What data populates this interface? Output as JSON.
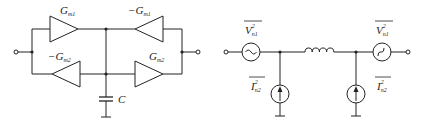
{
  "diagram": {
    "left_circuit": {
      "description": "Gyrator-C active inductor",
      "transconductors": [
        {
          "id": "top-left",
          "sign": "",
          "symbol": "G",
          "subscript": "m1",
          "direction": "right"
        },
        {
          "id": "top-right",
          "sign": "−",
          "symbol": "G",
          "subscript": "m1",
          "direction": "left"
        },
        {
          "id": "bottom-left",
          "sign": "−",
          "symbol": "G",
          "subscript": "m2",
          "direction": "left"
        },
        {
          "id": "bottom-right",
          "sign": "",
          "symbol": "G",
          "subscript": "m2",
          "direction": "right"
        }
      ],
      "capacitor": {
        "label": "C"
      }
    },
    "right_circuit": {
      "description": "Noise-equivalent circuit",
      "voltage_sources": [
        {
          "id": "left",
          "symbol": "V",
          "subscript": "n1",
          "superscript": "2"
        },
        {
          "id": "right",
          "symbol": "V",
          "subscript": "n1",
          "superscript": "2"
        }
      ],
      "current_sources": [
        {
          "id": "left",
          "symbol": "I",
          "subscript": "n2",
          "superscript": "2"
        },
        {
          "id": "right",
          "symbol": "I",
          "subscript": "n2",
          "superscript": "2"
        }
      ],
      "inductor": {
        "label": ""
      }
    },
    "colors": {
      "stroke": "#222222",
      "background": "#ffffff"
    }
  }
}
